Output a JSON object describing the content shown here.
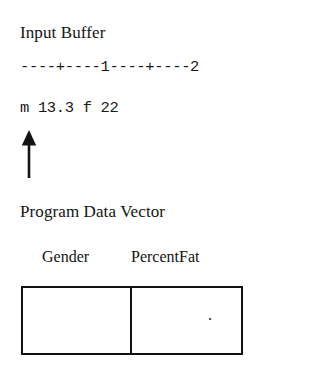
{
  "figure": {
    "background_color": "#ffffff",
    "ink_color": "#141414"
  },
  "input_buffer": {
    "title": "Input Buffer",
    "ruler": "----+----1----+----2",
    "data_line": "m 13.3 f 22",
    "pointer": {
      "icon": "up-arrow-icon",
      "direction": "up",
      "points_at_column": 1
    }
  },
  "program_data_vector": {
    "title": "Program Data Vector",
    "columns": [
      {
        "header": "Gender",
        "value": ""
      },
      {
        "header": "PercentFat",
        "value": "."
      }
    ]
  }
}
